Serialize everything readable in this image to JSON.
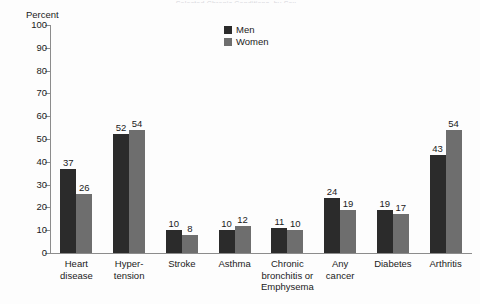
{
  "title_sliver": "Selected Chronic Conditions, by Sex",
  "axis_unit_label": "Percent",
  "legend": [
    {
      "label": "Men",
      "color": "#2b2b2b"
    },
    {
      "label": "Women",
      "color": "#6e6e6e"
    }
  ],
  "chart_data": {
    "type": "bar",
    "title": "Selected Chronic Conditions, by Sex",
    "xlabel": "",
    "ylabel": "Percent",
    "ylim": [
      0,
      100
    ],
    "yticks": [
      0,
      10,
      20,
      30,
      40,
      50,
      60,
      70,
      80,
      90,
      100
    ],
    "grid": false,
    "legend_position": "top-center",
    "categories": [
      "Heart disease",
      "Hyper-tension",
      "Stroke",
      "Asthma",
      "Chronic bronchitis or Emphysema",
      "Any cancer",
      "Diabetes",
      "Arthritis"
    ],
    "category_label_lines": [
      [
        "Heart",
        "disease"
      ],
      [
        "Hyper-",
        "tension"
      ],
      [
        "Stroke"
      ],
      [
        "Asthma"
      ],
      [
        "Chronic",
        "bronchitis or",
        "Emphysema"
      ],
      [
        "Any",
        "cancer"
      ],
      [
        "Diabetes"
      ],
      [
        "Arthritis"
      ]
    ],
    "series": [
      {
        "name": "Men",
        "color": "#2b2b2b",
        "values": [
          37,
          52,
          10,
          10,
          11,
          24,
          19,
          43
        ]
      },
      {
        "name": "Women",
        "color": "#6e6e6e",
        "values": [
          26,
          54,
          8,
          12,
          10,
          19,
          17,
          54
        ]
      }
    ]
  }
}
